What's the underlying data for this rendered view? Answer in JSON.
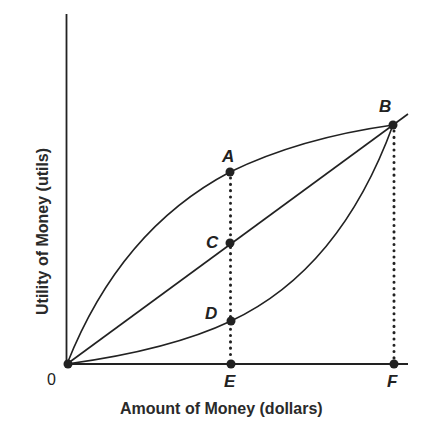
{
  "diagram": {
    "type": "utility-of-money",
    "axes": {
      "x_label": "Amount of Money (dollars)",
      "y_label": "Utility of Money (utils)",
      "origin_label": "0"
    },
    "curves": [
      {
        "name": "concave",
        "description": "Risk-averse utility curve through 0, A, B"
      },
      {
        "name": "linear",
        "description": "Risk-neutral straight line through 0, C, B"
      },
      {
        "name": "convex",
        "description": "Risk-loving utility curve through 0, D, B"
      }
    ],
    "points": {
      "A": "A",
      "B": "B",
      "C": "C",
      "D": "D",
      "E": "E",
      "F": "F"
    },
    "guides": [
      {
        "from": "A",
        "to": "E",
        "style": "dotted"
      },
      {
        "from": "B",
        "to": "F",
        "style": "dotted"
      }
    ],
    "colors": {
      "ink": "#222222",
      "background": "#ffffff"
    }
  }
}
